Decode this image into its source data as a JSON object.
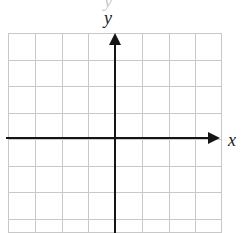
{
  "figure": {
    "kind": "coordinate-plane",
    "y_axis_label": "y",
    "x_axis_label": "x",
    "top_artifact_glyph": "y",
    "colors": {
      "grid": "#c8c8c8",
      "axis": "#151515",
      "background": "#ffffff",
      "label": "#1a1a1a",
      "artifact": "#c9c9c9"
    }
  },
  "chart_data": {
    "type": "scatter",
    "title": "",
    "xlabel": "x",
    "ylabel": "y",
    "series": [],
    "x": [],
    "values": [],
    "xlim": [
      -4,
      4
    ],
    "ylim": [
      -3.5,
      4
    ],
    "grid": true,
    "legend": "none",
    "tick_labels_x": [],
    "tick_labels_y": [],
    "annotations": []
  },
  "grid": {
    "columns": 8,
    "rows": 7.5,
    "cell_width_px": 26.75,
    "cell_height_px": 26.5,
    "origin_col_index": 4,
    "origin_row_index": 4,
    "vertical_line_offsets": [
      0,
      26.75,
      53.5,
      80.25,
      107,
      133.75,
      160.5,
      187.25,
      213
    ],
    "horizontal_line_offsets": [
      0,
      26.5,
      53,
      79.5,
      106,
      132.5,
      159,
      185.5,
      199
    ]
  }
}
